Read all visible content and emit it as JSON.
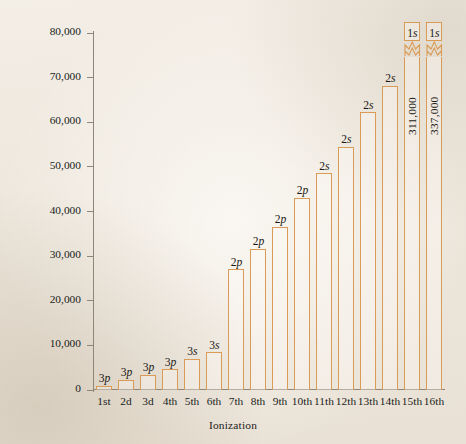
{
  "chart_data": {
    "type": "bar",
    "title": "",
    "xlabel": "Ionization",
    "ylabel": "Ionization energy, kJ mol",
    "ylabel_exponent": "−1",
    "grid": false,
    "legend": "none",
    "ylim": [
      0,
      80000
    ],
    "ytick_values": [
      0,
      10000,
      20000,
      30000,
      40000,
      50000,
      60000,
      70000,
      80000
    ],
    "ytick_labels": [
      "0",
      "10,000",
      "20,000",
      "30,000",
      "40,000",
      "50,000",
      "60,000",
      "70,000",
      "80,000"
    ],
    "categories": [
      "1st",
      "2d",
      "3d",
      "4th",
      "5th",
      "6th",
      "7th",
      "8th",
      "9th",
      "10th",
      "11th",
      "12th",
      "13th",
      "14th",
      "15th",
      "16th"
    ],
    "values": [
      1000,
      2300,
      3400,
      4600,
      7000,
      8500,
      27100,
      31700,
      36600,
      43100,
      48600,
      54500,
      62200,
      68200,
      311000,
      337000
    ],
    "annotations": [
      "3p",
      "3p",
      "3p",
      "3p",
      "3s",
      "3s",
      "2p",
      "2p",
      "2p",
      "2p",
      "2s",
      "2s",
      "2s",
      "2s",
      "1s",
      "1s"
    ],
    "bars": [
      {
        "category": "1st",
        "value": 1000,
        "orbital_n": "3",
        "orbital_l": "p",
        "off_scale": false,
        "value_label": ""
      },
      {
        "category": "2d",
        "value": 2300,
        "orbital_n": "3",
        "orbital_l": "p",
        "off_scale": false,
        "value_label": ""
      },
      {
        "category": "3d",
        "value": 3400,
        "orbital_n": "3",
        "orbital_l": "p",
        "off_scale": false,
        "value_label": ""
      },
      {
        "category": "4th",
        "value": 4600,
        "orbital_n": "3",
        "orbital_l": "p",
        "off_scale": false,
        "value_label": ""
      },
      {
        "category": "5th",
        "value": 7000,
        "orbital_n": "3",
        "orbital_l": "s",
        "off_scale": false,
        "value_label": ""
      },
      {
        "category": "6th",
        "value": 8500,
        "orbital_n": "3",
        "orbital_l": "s",
        "off_scale": false,
        "value_label": ""
      },
      {
        "category": "7th",
        "value": 27100,
        "orbital_n": "2",
        "orbital_l": "p",
        "off_scale": false,
        "value_label": ""
      },
      {
        "category": "8th",
        "value": 31700,
        "orbital_n": "2",
        "orbital_l": "p",
        "off_scale": false,
        "value_label": ""
      },
      {
        "category": "9th",
        "value": 36600,
        "orbital_n": "2",
        "orbital_l": "p",
        "off_scale": false,
        "value_label": ""
      },
      {
        "category": "10th",
        "value": 43100,
        "orbital_n": "2",
        "orbital_l": "p",
        "off_scale": false,
        "value_label": ""
      },
      {
        "category": "11th",
        "value": 48600,
        "orbital_n": "2",
        "orbital_l": "s",
        "off_scale": false,
        "value_label": ""
      },
      {
        "category": "12th",
        "value": 54500,
        "orbital_n": "2",
        "orbital_l": "s",
        "off_scale": false,
        "value_label": ""
      },
      {
        "category": "13th",
        "value": 62200,
        "orbital_n": "2",
        "orbital_l": "s",
        "off_scale": false,
        "value_label": ""
      },
      {
        "category": "14th",
        "value": 68200,
        "orbital_n": "2",
        "orbital_l": "s",
        "off_scale": false,
        "value_label": ""
      },
      {
        "category": "15th",
        "value": 311000,
        "orbital_n": "1",
        "orbital_l": "s",
        "off_scale": true,
        "value_label": "311,000"
      },
      {
        "category": "16th",
        "value": 337000,
        "orbital_n": "1",
        "orbital_l": "s",
        "off_scale": true,
        "value_label": "337,000"
      }
    ],
    "colors": {
      "bar_outline": "#d99b55",
      "axis": "#8d8679",
      "text": "#1c1a18",
      "background": "#efe9e0"
    }
  }
}
